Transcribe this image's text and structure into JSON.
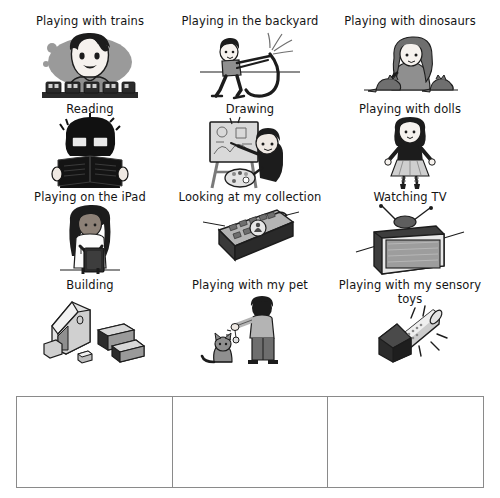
{
  "page": {
    "background_color": "#ffffff"
  },
  "activities": [
    {
      "id": "trains",
      "label": "Playing with trains",
      "icon": "train-play-icon",
      "lines": 1
    },
    {
      "id": "backyard",
      "label": "Playing in the backyard",
      "icon": "hose-backyard-icon",
      "lines": 1
    },
    {
      "id": "dinosaurs",
      "label": "Playing with dinosaurs",
      "icon": "dinosaur-play-icon",
      "lines": 1
    },
    {
      "id": "reading",
      "label": "Reading",
      "icon": "reading-book-icon",
      "lines": 1
    },
    {
      "id": "drawing",
      "label": "Drawing",
      "icon": "easel-painting-icon",
      "lines": 1
    },
    {
      "id": "dolls",
      "label": "Playing with dolls",
      "icon": "doll-icon",
      "lines": 1
    },
    {
      "id": "ipad",
      "label": "Playing on the iPad",
      "icon": "tablet-play-icon",
      "lines": 1
    },
    {
      "id": "collection",
      "label": "Looking at my collection",
      "icon": "collection-box-icon",
      "lines": 2
    },
    {
      "id": "tv",
      "label": "Watching TV",
      "icon": "television-icon",
      "lines": 1
    },
    {
      "id": "building",
      "label": "Building",
      "icon": "building-blocks-icon",
      "lines": 1
    },
    {
      "id": "pet",
      "label": "Playing with my pet",
      "icon": "pet-cat-icon",
      "lines": 1
    },
    {
      "id": "sensory",
      "label": "Playing with my sensory toys",
      "icon": "flashlight-icon",
      "lines": 2
    }
  ],
  "answer_table": {
    "columns": 3,
    "cells": [
      "",
      "",
      ""
    ],
    "border_color": "#8a8a8a"
  },
  "colors": {
    "ink": "#141414",
    "mid_grey": "#8c8c8c",
    "light_grey": "#c9c9c9",
    "dark": "#1c1c1c",
    "table_border": "#8a8a8a"
  }
}
